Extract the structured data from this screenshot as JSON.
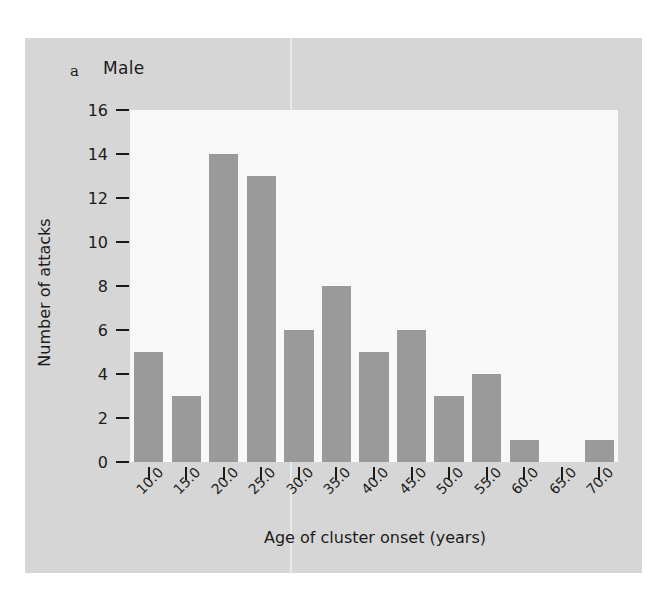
{
  "figure": {
    "panel_letter": "a",
    "title": "Male",
    "background_color": "#d6d6d6",
    "plot_background_color": "#f8f8f8",
    "bar_color": "#9a9a9a",
    "axis_color": "#1a1a1a"
  },
  "chart_data": {
    "type": "bar",
    "title": "Male",
    "xlabel": "Age of cluster onset (years)",
    "ylabel": "Number of attacks",
    "categories": [
      "10.0",
      "15.0",
      "20.0",
      "25.0",
      "30.0",
      "35.0",
      "40.0",
      "45.0",
      "50.0",
      "55.0",
      "60.0",
      "65.0",
      "70.0"
    ],
    "values": [
      5,
      3,
      14,
      13,
      6,
      8,
      5,
      6,
      3,
      4,
      1,
      0,
      1
    ],
    "xtick_labels": [
      "10.0",
      "15.0",
      "20.0",
      "25.0",
      "30.0",
      "35.0",
      "40.0",
      "45.0",
      "50.0",
      "55.0",
      "60.0",
      "65.0",
      "70.0"
    ],
    "ytick_labels": [
      "0",
      "2",
      "4",
      "6",
      "8",
      "10",
      "12",
      "14",
      "16"
    ],
    "ytick_values": [
      0,
      2,
      4,
      6,
      8,
      10,
      12,
      14,
      16
    ],
    "ylim": [
      0,
      16
    ],
    "grid": false,
    "legend": "none",
    "xtick_rotation": -45
  }
}
